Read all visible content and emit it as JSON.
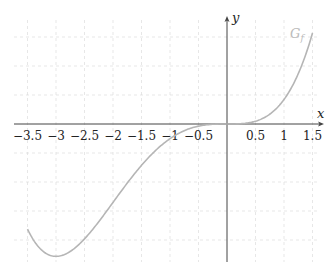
{
  "chart_data": {
    "type": "line",
    "title": "",
    "xlabel": "x",
    "ylabel": "y",
    "xlim": [
      -3.7,
      1.7
    ],
    "ylim": [
      -2.4,
      1.8
    ],
    "grid": true,
    "x_ticks": [
      "−3.5",
      "−3",
      "−2.5",
      "−2",
      "−1.5",
      "−1",
      "−0.5",
      "0.5",
      "1",
      "1.5"
    ],
    "series": [
      {
        "name": "G_f",
        "color": "#b5b5b5",
        "x": [
          -3.5,
          -3.0,
          -2.5,
          -2.0,
          -1.5,
          -1.0,
          -0.5,
          0.0,
          0.5,
          1.0,
          1.5
        ],
        "values": [
          -1.81,
          -2.28,
          -1.98,
          -1.35,
          -0.71,
          -0.25,
          -0.04,
          0.0,
          0.05,
          0.42,
          1.57
        ]
      }
    ],
    "annotations": [
      {
        "text": "G_f",
        "x": 1.3,
        "y": 1.55
      }
    ]
  },
  "labels": {
    "x_axis": "x",
    "y_axis": "y",
    "curve_main": "G",
    "curve_sub": "f"
  }
}
